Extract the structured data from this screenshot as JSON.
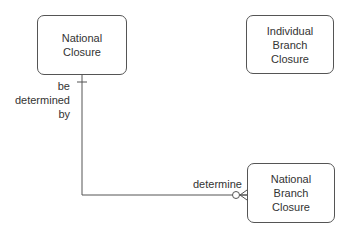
{
  "entities": [
    {
      "id": "national-closure",
      "label": "National\nClosure",
      "lines": [
        "National",
        "Closure"
      ]
    },
    {
      "id": "individual-branch-closure",
      "label": "Individual Branch Closure",
      "lines": [
        "Individual",
        "Branch",
        "Closure"
      ]
    },
    {
      "id": "national-branch-closure",
      "label": "National Branch Closure",
      "lines": [
        "National",
        "Branch",
        "Closure"
      ]
    }
  ],
  "relationship": {
    "from": "national-closure",
    "to": "national-branch-closure",
    "from_cardinality": "exactly-one",
    "to_cardinality": "zero-or-many",
    "from_label_lines": [
      "be",
      "determined",
      "by"
    ],
    "to_label": "determine"
  },
  "colors": {
    "line": "#555555",
    "text": "#333333",
    "background": "#ffffff"
  }
}
